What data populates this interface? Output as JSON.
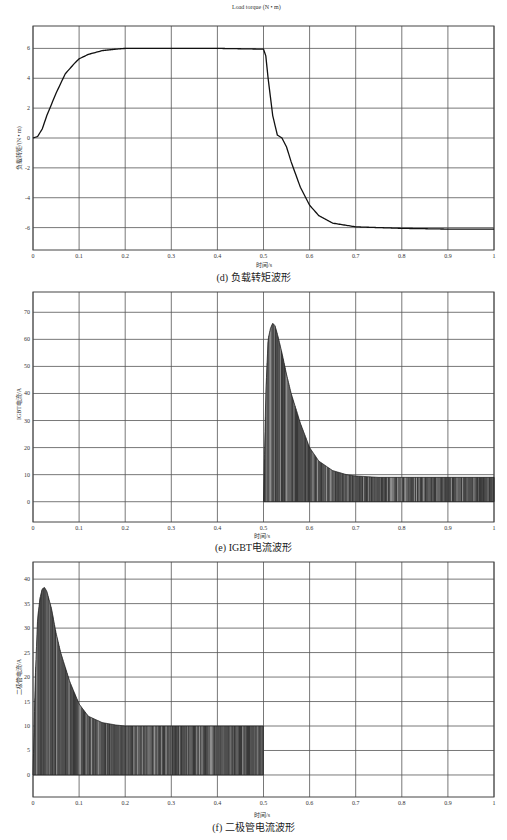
{
  "chart_data": [
    {
      "id": "d",
      "type": "line",
      "title": "Load torque (N • m)",
      "caption": "(d) 负载转矩波形",
      "xlabel": "时间/s",
      "ylabel": "负载转矩/(N • m)",
      "xlim": [
        0,
        1
      ],
      "ylim": [
        -7.5,
        7.5
      ],
      "xticks": [
        "0",
        "0.1",
        "0.2",
        "0.3",
        "0.4",
        "0.5",
        "0.6",
        "0.7",
        "0.8",
        "0.9",
        "1"
      ],
      "yticks": [
        "-6",
        "-4",
        "-2",
        "0",
        "2",
        "4",
        "6"
      ],
      "grid": true,
      "series": [
        {
          "name": "Load torque",
          "x": [
            0,
            0.01,
            0.02,
            0.03,
            0.05,
            0.07,
            0.09,
            0.1,
            0.12,
            0.15,
            0.18,
            0.2,
            0.3,
            0.4,
            0.5,
            0.505,
            0.51,
            0.52,
            0.53,
            0.54,
            0.55,
            0.56,
            0.58,
            0.6,
            0.62,
            0.65,
            0.7,
            0.8,
            0.9,
            1.0
          ],
          "y": [
            0,
            0.1,
            0.6,
            1.5,
            3.0,
            4.3,
            5.0,
            5.3,
            5.6,
            5.85,
            5.95,
            6.0,
            6.0,
            6.0,
            5.95,
            5.5,
            4.0,
            1.5,
            0.2,
            0.0,
            -0.6,
            -1.6,
            -3.3,
            -4.5,
            -5.2,
            -5.7,
            -5.95,
            -6.05,
            -6.1,
            -6.1
          ]
        }
      ]
    },
    {
      "id": "e",
      "type": "area",
      "title": "",
      "caption": "(e) IGBT电流波形",
      "xlabel": "时间/s",
      "ylabel": "IGBT电流/A",
      "xlim": [
        0,
        1
      ],
      "ylim": [
        -7.5,
        77.5
      ],
      "xticks": [
        "0",
        "0.1",
        "0.2",
        "0.3",
        "0.4",
        "0.5",
        "0.6",
        "0.7",
        "0.8",
        "0.9",
        "1"
      ],
      "yticks": [
        "0",
        "10",
        "20",
        "30",
        "40",
        "50",
        "60",
        "70"
      ],
      "grid": true,
      "series": [
        {
          "name": "IGBT current envelope (PWM chopped, lower bound 0)",
          "x": [
            0.5,
            0.505,
            0.51,
            0.515,
            0.52,
            0.525,
            0.53,
            0.54,
            0.55,
            0.56,
            0.58,
            0.6,
            0.62,
            0.65,
            0.68,
            0.7,
            0.75,
            0.8,
            0.9,
            1.0
          ],
          "y": [
            0,
            40,
            60,
            64,
            66,
            65,
            62,
            55,
            47,
            40,
            29,
            20,
            15,
            11.5,
            10,
            9.5,
            9,
            9,
            9,
            9
          ]
        }
      ]
    },
    {
      "id": "f",
      "type": "area",
      "title": "",
      "caption": "(f) 二极管电流波形",
      "xlabel": "时间/s",
      "ylabel": "二极管电流/A",
      "xlim": [
        0,
        1
      ],
      "ylim": [
        -4.5,
        43.5
      ],
      "xticks": [
        "0",
        "0.1",
        "0.2",
        "0.3",
        "0.4",
        "0.5",
        "0.6",
        "0.7",
        "0.8",
        "0.9",
        "1"
      ],
      "yticks": [
        "0",
        "5",
        "10",
        "15",
        "20",
        "25",
        "30",
        "35",
        "40"
      ],
      "grid": true,
      "series": [
        {
          "name": "Diode current envelope (PWM chopped, lower bound 0)",
          "x": [
            0.0,
            0.005,
            0.01,
            0.015,
            0.02,
            0.025,
            0.03,
            0.04,
            0.05,
            0.06,
            0.08,
            0.1,
            0.12,
            0.15,
            0.18,
            0.2,
            0.3,
            0.4,
            0.5
          ],
          "y": [
            0,
            20,
            32,
            36,
            38,
            38.3,
            37.5,
            34,
            29,
            25,
            19,
            14.5,
            12,
            10.7,
            10.2,
            10,
            10,
            10,
            10
          ]
        }
      ]
    }
  ]
}
